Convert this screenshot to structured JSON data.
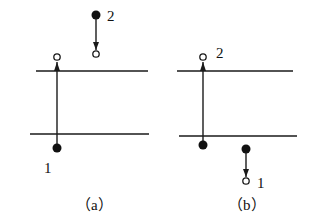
{
  "figure": {
    "panels": [
      {
        "id": "a",
        "caption": "（a）",
        "point_labels": [
          "1",
          "2"
        ],
        "description": "Point 1 below lower line moves up past upper line; point 2 above moves down"
      },
      {
        "id": "b",
        "caption": "（b）",
        "point_labels": [
          "2",
          "1"
        ],
        "description": "Point 2 moves up above upper line; point 1 moves down below lower line"
      }
    ]
  }
}
